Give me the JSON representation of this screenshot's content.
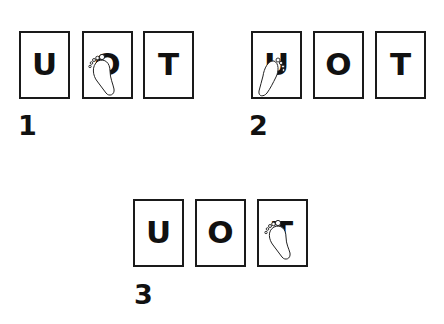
{
  "panels": [
    {
      "label": "1",
      "letters": [
        "U",
        "O",
        "T"
      ],
      "footprint_on": 1
    },
    {
      "label": "2",
      "letters": [
        "U",
        "O",
        "T"
      ],
      "footprint_on": 0
    },
    {
      "label": "3",
      "letters": [
        "U",
        "O",
        "T"
      ],
      "footprint_on": 2
    }
  ],
  "icons": {
    "footprint": "footprint-icon"
  },
  "colors": {
    "stroke": "#1a1a1a",
    "background": "#ffffff"
  }
}
